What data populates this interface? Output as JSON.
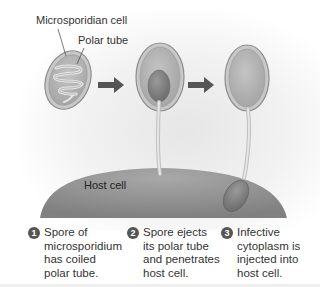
{
  "labels": {
    "microsporidian_cell": "Microsporidian cell",
    "polar_tube": "Polar tube",
    "host_cell": "Host cell"
  },
  "steps": [
    {
      "number": "1",
      "lines": [
        "Spore of",
        "microsporidium",
        "has coiled",
        "polar tube."
      ]
    },
    {
      "number": "2",
      "lines": [
        "Spore ejects",
        "its polar tube",
        "and penetrates",
        "host cell."
      ]
    },
    {
      "number": "3",
      "lines": [
        "Infective",
        "cytoplasm is",
        "injected into",
        "host cell."
      ]
    }
  ],
  "colors": {
    "spore_fill": "#b8b8b8",
    "spore_rim": "#9a9a9a",
    "host_cell": "#8c8c8c",
    "arrow": "#555555",
    "badge": "#555555"
  }
}
